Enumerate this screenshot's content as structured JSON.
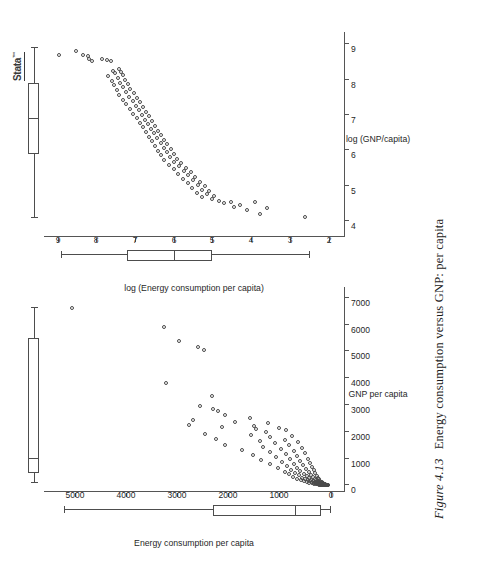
{
  "caption": {
    "figure_number": "Figure 4.13",
    "text": "Energy consumption versus GNP: per capita"
  },
  "logo": {
    "name": "Stata",
    "trademark": "™"
  },
  "chart_data": [
    {
      "id": "panel-raw",
      "type": "scatter",
      "title": "",
      "xlabel": "GNP per capita",
      "ylabel": "Energy consumption per capita",
      "xticks": [
        0,
        1000,
        2000,
        3000,
        4000,
        5000,
        6000,
        7000
      ],
      "yticks": [
        0,
        1000,
        2000,
        3000,
        4000,
        5000
      ],
      "xlim": [
        -250,
        7400
      ],
      "ylim": [
        -260,
        5600
      ],
      "grid": false,
      "legend": "none",
      "marginal_boxplots": {
        "x": {
          "min": 80,
          "q1": 460,
          "median": 1000,
          "q3": 5500,
          "max": 6600,
          "orientation": "horizontal"
        },
        "y": {
          "min": 20,
          "q1": 180,
          "median": 700,
          "q3": 2300,
          "max": 5200,
          "orientation": "vertical"
        }
      },
      "points": [
        [
          6620,
          5060
        ],
        [
          5920,
          3260
        ],
        [
          5380,
          2960
        ],
        [
          5150,
          2600
        ],
        [
          5060,
          2480
        ],
        [
          3800,
          3220
        ],
        [
          3330,
          2320
        ],
        [
          2970,
          2560
        ],
        [
          2860,
          2300
        ],
        [
          2780,
          2210
        ],
        [
          2640,
          2060
        ],
        [
          2520,
          1570
        ],
        [
          2420,
          2680
        ],
        [
          2350,
          1860
        ],
        [
          2330,
          1230
        ],
        [
          2260,
          2760
        ],
        [
          2200,
          1500
        ],
        [
          2180,
          2120
        ],
        [
          2140,
          1000
        ],
        [
          2090,
          1460
        ],
        [
          2060,
          880
        ],
        [
          1980,
          1270
        ],
        [
          1920,
          2460
        ],
        [
          1880,
          1560
        ],
        [
          1840,
          760
        ],
        [
          1790,
          1180
        ],
        [
          1740,
          2240
        ],
        [
          1700,
          900
        ],
        [
          1660,
          1390
        ],
        [
          1620,
          640
        ],
        [
          1560,
          1080
        ],
        [
          1520,
          2060
        ],
        [
          1490,
          810
        ],
        [
          1440,
          1320
        ],
        [
          1400,
          560
        ],
        [
          1360,
          980
        ],
        [
          1320,
          1740
        ],
        [
          1280,
          720
        ],
        [
          1240,
          1190
        ],
        [
          1200,
          500
        ],
        [
          1160,
          880
        ],
        [
          1120,
          1520
        ],
        [
          1080,
          660
        ],
        [
          1040,
          1060
        ],
        [
          1000,
          440
        ],
        [
          970,
          800
        ],
        [
          940,
          1360
        ],
        [
          900,
          600
        ],
        [
          870,
          950
        ],
        [
          840,
          400
        ],
        [
          810,
          720
        ],
        [
          780,
          1180
        ],
        [
          750,
          540
        ],
        [
          720,
          860
        ],
        [
          690,
          360
        ],
        [
          660,
          650
        ],
        [
          640,
          1020
        ],
        [
          610,
          480
        ],
        [
          580,
          780
        ],
        [
          560,
          330
        ],
        [
          540,
          590
        ],
        [
          510,
          900
        ],
        [
          490,
          430
        ],
        [
          470,
          700
        ],
        [
          450,
          300
        ],
        [
          430,
          530
        ],
        [
          410,
          810
        ],
        [
          390,
          390
        ],
        [
          370,
          620
        ],
        [
          350,
          270
        ],
        [
          340,
          470
        ],
        [
          320,
          730
        ],
        [
          300,
          350
        ],
        [
          290,
          560
        ],
        [
          275,
          245
        ],
        [
          260,
          420
        ],
        [
          250,
          650
        ],
        [
          240,
          310
        ],
        [
          230,
          500
        ],
        [
          220,
          225
        ],
        [
          210,
          380
        ],
        [
          200,
          580
        ],
        [
          195,
          280
        ],
        [
          185,
          450
        ],
        [
          178,
          205
        ],
        [
          170,
          340
        ],
        [
          162,
          520
        ],
        [
          155,
          250
        ],
        [
          148,
          400
        ],
        [
          140,
          185
        ],
        [
          134,
          305
        ],
        [
          128,
          465
        ],
        [
          122,
          225
        ],
        [
          116,
          360
        ],
        [
          110,
          168
        ],
        [
          105,
          270
        ],
        [
          100,
          415
        ],
        [
          95,
          200
        ],
        [
          90,
          320
        ],
        [
          86,
          150
        ],
        [
          82,
          240
        ],
        [
          78,
          370
        ],
        [
          74,
          178
        ],
        [
          70,
          285
        ],
        [
          66,
          135
        ],
        [
          62,
          212
        ],
        [
          58,
          330
        ],
        [
          55,
          158
        ],
        [
          52,
          252
        ],
        [
          49,
          120
        ],
        [
          46,
          188
        ],
        [
          43,
          292
        ],
        [
          40,
          140
        ],
        [
          37,
          222
        ],
        [
          35,
          106
        ],
        [
          33,
          166
        ],
        [
          31,
          258
        ],
        [
          29,
          124
        ],
        [
          27,
          196
        ],
        [
          25,
          94
        ],
        [
          23,
          146
        ],
        [
          21,
          228
        ],
        [
          19,
          110
        ],
        [
          18,
          172
        ],
        [
          17,
          82
        ],
        [
          16,
          128
        ],
        [
          15,
          200
        ],
        [
          14,
          96
        ],
        [
          13,
          150
        ],
        [
          12,
          72
        ],
        [
          11,
          112
        ],
        [
          10,
          175
        ],
        [
          9,
          84
        ],
        [
          8,
          130
        ],
        [
          7,
          62
        ],
        [
          6,
          98
        ],
        [
          5,
          152
        ],
        [
          4,
          73
        ],
        [
          3,
          114
        ],
        [
          2,
          54
        ]
      ]
    },
    {
      "id": "panel-log",
      "type": "scatter",
      "title": "",
      "xlabel": "log (GNP/capita)",
      "ylabel": "log (Energy consumption per capita)",
      "xticks": [
        4,
        5,
        6,
        7,
        8,
        9
      ],
      "yticks": [
        2,
        3,
        4,
        5,
        6,
        7,
        8,
        9
      ],
      "xlim": [
        3.55,
        9.35
      ],
      "ylim": [
        1.6,
        9.35
      ],
      "grid": false,
      "legend": "none",
      "marginal_boxplots": {
        "x": {
          "min": 4.1,
          "q1": 5.9,
          "median": 6.9,
          "q3": 7.9,
          "max": 8.9,
          "orientation": "horizontal"
        },
        "y": {
          "min": 2.5,
          "q1": 5.0,
          "median": 6.0,
          "q3": 7.2,
          "max": 8.9,
          "orientation": "vertical"
        }
      },
      "points": [
        [
          8.8,
          8.53
        ],
        [
          8.7,
          8.35
        ],
        [
          8.66,
          8.22
        ],
        [
          8.58,
          8.18
        ],
        [
          8.52,
          8.1
        ],
        [
          8.69,
          8.95
        ],
        [
          8.58,
          7.85
        ],
        [
          8.55,
          7.72
        ],
        [
          8.52,
          7.62
        ],
        [
          8.3,
          7.4
        ],
        [
          8.26,
          7.58
        ],
        [
          8.22,
          7.35
        ],
        [
          8.18,
          7.52
        ],
        [
          8.13,
          7.3
        ],
        [
          8.1,
          7.7
        ],
        [
          8.05,
          7.45
        ],
        [
          8.0,
          7.25
        ],
        [
          7.96,
          7.6
        ],
        [
          7.92,
          7.38
        ],
        [
          7.88,
          7.18
        ],
        [
          7.84,
          7.55
        ],
        [
          7.8,
          7.3
        ],
        [
          7.75,
          7.12
        ],
        [
          7.7,
          7.47
        ],
        [
          7.66,
          7.22
        ],
        [
          7.62,
          7.02
        ],
        [
          7.57,
          7.4
        ],
        [
          7.52,
          7.15
        ],
        [
          7.48,
          6.95
        ],
        [
          7.44,
          7.3
        ],
        [
          7.4,
          7.06
        ],
        [
          7.36,
          6.88
        ],
        [
          7.31,
          7.22
        ],
        [
          7.27,
          6.98
        ],
        [
          7.22,
          6.8
        ],
        [
          7.18,
          7.12
        ],
        [
          7.13,
          6.9
        ],
        [
          7.09,
          6.72
        ],
        [
          7.04,
          7.04
        ],
        [
          7.0,
          6.82
        ],
        [
          6.96,
          6.64
        ],
        [
          6.92,
          6.96
        ],
        [
          6.87,
          6.74
        ],
        [
          6.83,
          6.56
        ],
        [
          6.78,
          6.88
        ],
        [
          6.74,
          6.66
        ],
        [
          6.7,
          6.48
        ],
        [
          6.65,
          6.8
        ],
        [
          6.61,
          6.58
        ],
        [
          6.56,
          6.4
        ],
        [
          6.52,
          6.72
        ],
        [
          6.48,
          6.5
        ],
        [
          6.43,
          6.32
        ],
        [
          6.39,
          6.64
        ],
        [
          6.34,
          6.42
        ],
        [
          6.3,
          6.24
        ],
        [
          6.26,
          6.56
        ],
        [
          6.21,
          6.34
        ],
        [
          6.17,
          6.16
        ],
        [
          6.12,
          6.48
        ],
        [
          6.08,
          6.26
        ],
        [
          6.04,
          6.08
        ],
        [
          5.99,
          6.4
        ],
        [
          5.95,
          6.18
        ],
        [
          5.9,
          6.0
        ],
        [
          5.86,
          6.32
        ],
        [
          5.82,
          6.1
        ],
        [
          5.77,
          5.92
        ],
        [
          5.73,
          6.24
        ],
        [
          5.68,
          5.98
        ],
        [
          5.64,
          5.8
        ],
        [
          5.6,
          6.12
        ],
        [
          5.55,
          5.86
        ],
        [
          5.51,
          5.68
        ],
        [
          5.46,
          6.0
        ],
        [
          5.42,
          5.74
        ],
        [
          5.38,
          5.56
        ],
        [
          5.33,
          5.88
        ],
        [
          5.29,
          5.62
        ],
        [
          5.24,
          5.44
        ],
        [
          5.2,
          5.76
        ],
        [
          5.16,
          5.5
        ],
        [
          5.11,
          5.32
        ],
        [
          5.07,
          5.64
        ],
        [
          5.02,
          5.38
        ],
        [
          4.98,
          5.2
        ],
        [
          4.94,
          5.52
        ],
        [
          4.89,
          5.26
        ],
        [
          4.85,
          5.08
        ],
        [
          4.8,
          5.4
        ],
        [
          4.76,
          5.14
        ],
        [
          4.72,
          4.96
        ],
        [
          4.67,
          5.28
        ],
        [
          4.63,
          5.02
        ],
        [
          4.58,
          4.84
        ],
        [
          4.54,
          4.52
        ],
        [
          4.5,
          4.7
        ],
        [
          4.45,
          4.28
        ],
        [
          4.41,
          4.44
        ],
        [
          4.36,
          3.6
        ],
        [
          4.55,
          3.9
        ],
        [
          4.3,
          4.1
        ],
        [
          4.2,
          3.78
        ],
        [
          4.12,
          2.62
        ]
      ]
    }
  ]
}
